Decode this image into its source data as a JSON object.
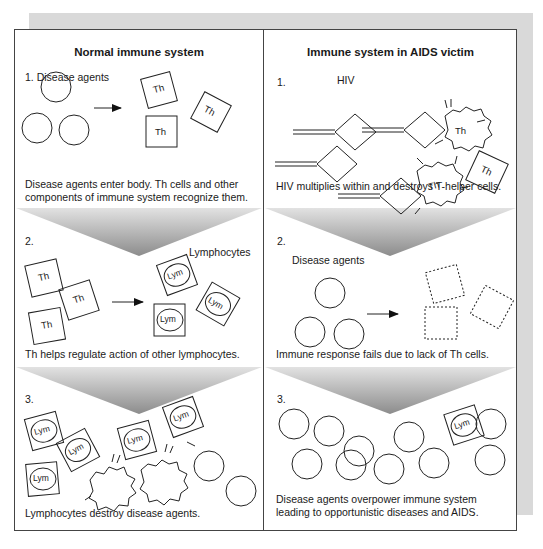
{
  "figure": {
    "left_column": {
      "title": "Normal immune system",
      "panels": [
        {
          "step": "1. Disease agents",
          "caption_line1": "Disease agents enter body. Th cells and other",
          "caption_line2": "components of immune system recognize them.",
          "cell_label": "Th"
        },
        {
          "step": "2.",
          "group_label": "Lymphocytes",
          "caption_line1": "Th helps regulate action of other lymphocytes.",
          "cell_label_th": "Th",
          "cell_label_lym": "Lym"
        },
        {
          "step": "3.",
          "caption_line1": "Lymphocytes destroy disease agents.",
          "cell_label_lym": "Lym"
        }
      ]
    },
    "right_column": {
      "title": "Immune system in AIDS victim",
      "panels": [
        {
          "step": "1.",
          "group_label": "HIV",
          "caption_line1": "HIV multiplies within and destroys T-helper cells.",
          "cell_label": "Th"
        },
        {
          "step": "2.",
          "group_label": "Disease agents",
          "caption_line1": "Immune response fails due to lack of Th cells."
        },
        {
          "step": "3.",
          "caption_line1": "Disease agents overpower immune system",
          "caption_line2": "leading to opportunistic diseases and AIDS.",
          "cell_label_lym": "Lym"
        }
      ]
    },
    "colors": {
      "ink": "#1a1a1a",
      "frame_border": "#444444",
      "shadow": "#d9d9d9",
      "gradient_dark": "#8a8a8a",
      "gradient_light": "#e6e6e6"
    }
  }
}
